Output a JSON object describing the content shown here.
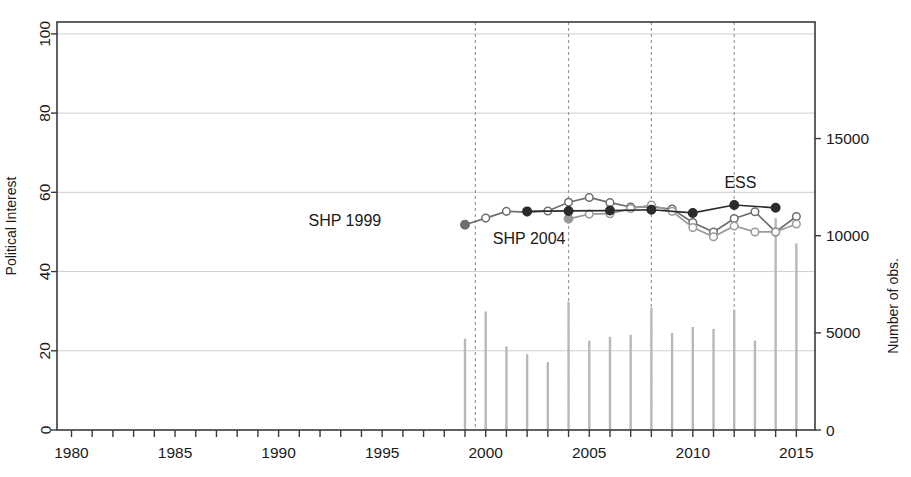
{
  "chart_data": {
    "type": "line",
    "title": "",
    "xlabel": "",
    "ylabel": "Political Interest",
    "y2label": "Number of obs.",
    "xlim": [
      1979.3,
      2015.9
    ],
    "ylim": [
      0,
      103
    ],
    "y2lim": [
      0,
      21000
    ],
    "grid": true,
    "grid_axis": "y",
    "legend": "inline-annotations",
    "xticks": [
      1980,
      1981,
      1982,
      1983,
      1984,
      1985,
      1986,
      1987,
      1988,
      1989,
      1990,
      1991,
      1992,
      1993,
      1994,
      1995,
      1996,
      1997,
      1998,
      1999,
      2000,
      2001,
      2002,
      2003,
      2004,
      2005,
      2006,
      2007,
      2008,
      2009,
      2010,
      2011,
      2012,
      2013,
      2014,
      2015
    ],
    "xticklabels": [
      {
        "x": 1980,
        "label": "1980"
      },
      {
        "x": 1985,
        "label": "1985"
      },
      {
        "x": 1990,
        "label": "1990"
      },
      {
        "x": 1995,
        "label": "1995"
      },
      {
        "x": 2000,
        "label": "2000"
      },
      {
        "x": 2005,
        "label": "2005"
      },
      {
        "x": 2010,
        "label": "2010"
      },
      {
        "x": 2015,
        "label": "2015"
      }
    ],
    "yticks": [
      0,
      20,
      40,
      60,
      80,
      100
    ],
    "yticklabels": [
      "0",
      "20",
      "40",
      "60",
      "80",
      "100"
    ],
    "y2ticks": [
      0,
      5000,
      10000,
      15000
    ],
    "y2ticklabels": [
      "0",
      "5000",
      "10000",
      "15000"
    ],
    "vlines": [
      {
        "x": 1999.5,
        "style": "dashed",
        "color": "#999999"
      },
      {
        "x": 2004.0,
        "style": "dashed",
        "color": "#999999"
      },
      {
        "x": 2008.0,
        "style": "dashed",
        "color": "#999999"
      },
      {
        "x": 2012.0,
        "style": "dashed",
        "color": "#999999"
      }
    ],
    "series": [
      {
        "name": "SHP 1999",
        "color": "#6e6e6e",
        "marker": "circle-open",
        "label_text": "SHP 1999",
        "label_x": 1993.2,
        "label_y": 51.5,
        "points": [
          {
            "x": 1999,
            "y": 51.8,
            "filled": true
          },
          {
            "x": 2000,
            "y": 53.5
          },
          {
            "x": 2001,
            "y": 55.2
          },
          {
            "x": 2002,
            "y": 55.0
          },
          {
            "x": 2003,
            "y": 55.3
          },
          {
            "x": 2004,
            "y": 57.5
          },
          {
            "x": 2005,
            "y": 58.7
          },
          {
            "x": 2006,
            "y": 57.4
          },
          {
            "x": 2007,
            "y": 56.3
          },
          {
            "x": 2008,
            "y": 56.3
          },
          {
            "x": 2009,
            "y": 55.8
          },
          {
            "x": 2010,
            "y": 52.4
          },
          {
            "x": 2011,
            "y": 50.0
          },
          {
            "x": 2012,
            "y": 53.4
          },
          {
            "x": 2013,
            "y": 55.1
          },
          {
            "x": 2014,
            "y": 50.0
          },
          {
            "x": 2015,
            "y": 53.9
          }
        ]
      },
      {
        "name": "SHP 2004",
        "color": "#9a9a9a",
        "marker": "circle-open",
        "label_text": "SHP 2004",
        "label_x": 2002.1,
        "label_y": 47.0,
        "points": [
          {
            "x": 2004,
            "y": 53.3,
            "filled": true
          },
          {
            "x": 2005,
            "y": 54.5
          },
          {
            "x": 2006,
            "y": 54.6
          },
          {
            "x": 2007,
            "y": 55.9
          },
          {
            "x": 2008,
            "y": 56.8
          },
          {
            "x": 2009,
            "y": 55.2
          },
          {
            "x": 2010,
            "y": 51.1
          },
          {
            "x": 2011,
            "y": 48.8
          },
          {
            "x": 2012,
            "y": 51.5
          },
          {
            "x": 2013,
            "y": 50.0
          },
          {
            "x": 2014,
            "y": 50.0
          },
          {
            "x": 2015,
            "y": 52.0
          }
        ]
      },
      {
        "name": "ESS",
        "color": "#2b2b2b",
        "marker": "circle-filled",
        "label_text": "ESS",
        "label_x": 2012.3,
        "label_y": 61.0,
        "points": [
          {
            "x": 2002,
            "y": 55.2
          },
          {
            "x": 2004,
            "y": 55.3
          },
          {
            "x": 2006,
            "y": 55.4
          },
          {
            "x": 2008,
            "y": 55.6
          },
          {
            "x": 2010,
            "y": 54.8
          },
          {
            "x": 2012,
            "y": 56.8
          },
          {
            "x": 2014,
            "y": 56.1
          }
        ]
      }
    ],
    "bars": {
      "name": "Number of observations",
      "color": "#b8b8b8",
      "axis": "right",
      "values": [
        {
          "x": 1999,
          "y": 4700
        },
        {
          "x": 2000,
          "y": 6100
        },
        {
          "x": 2001,
          "y": 4300
        },
        {
          "x": 2002,
          "y": 3900
        },
        {
          "x": 2003,
          "y": 3500
        },
        {
          "x": 2004,
          "y": 6600
        },
        {
          "x": 2005,
          "y": 4600
        },
        {
          "x": 2006,
          "y": 4800
        },
        {
          "x": 2007,
          "y": 4900
        },
        {
          "x": 2008,
          "y": 6300
        },
        {
          "x": 2009,
          "y": 5000
        },
        {
          "x": 2010,
          "y": 5300
        },
        {
          "x": 2011,
          "y": 5200
        },
        {
          "x": 2012,
          "y": 6200
        },
        {
          "x": 2013,
          "y": 4600
        },
        {
          "x": 2014,
          "y": 10900
        },
        {
          "x": 2015,
          "y": 9600
        }
      ]
    }
  }
}
